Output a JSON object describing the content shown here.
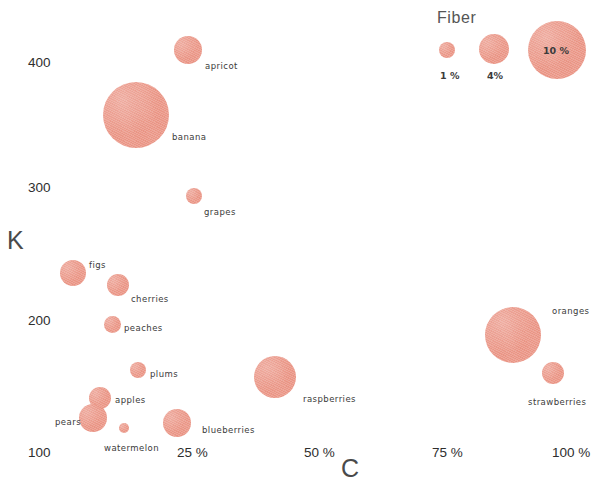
{
  "chart_data": {
    "type": "scatter",
    "title": "",
    "xlabel": "C",
    "ylabel": "K",
    "xlim": [
      0,
      112
    ],
    "ylim": [
      75,
      440
    ],
    "grid": false,
    "x_unit": "%",
    "y_unit": "mg",
    "size_variable": "Fiber",
    "size_unit": "%",
    "bubble_color": "#ec9585",
    "xticks": [
      "25 %",
      "50 %",
      "75 %",
      "100 %"
    ],
    "xtick_values": [
      25,
      50,
      75,
      100
    ],
    "yticks": [
      "100",
      "200",
      "300",
      "400"
    ],
    "ytick_values": [
      100,
      200,
      300,
      400
    ],
    "points": [
      {
        "label": "banana",
        "x": 11.0,
        "y": 395,
        "fiber": 10.0,
        "px": 136,
        "py": 115,
        "r": 33,
        "lx": 172,
        "ly": 133
      },
      {
        "label": "apricot",
        "x": 21.5,
        "y": 440,
        "fiber": 4.2,
        "px": 188,
        "py": 50,
        "r": 14,
        "lx": 205,
        "ly": 62
      },
      {
        "label": "grapes",
        "x": 23.5,
        "y": 299,
        "fiber": 1.4,
        "px": 194,
        "py": 196,
        "r": 8,
        "lx": 204,
        "ly": 208
      },
      {
        "label": "figs",
        "x": 0.5,
        "y": 235,
        "fiber": 3.8,
        "px": 73,
        "py": 273,
        "r": 13,
        "lx": 89,
        "ly": 261
      },
      {
        "label": "cherries",
        "x": 9.5,
        "y": 224,
        "fiber": 2.9,
        "px": 118,
        "py": 285,
        "r": 11,
        "lx": 131,
        "ly": 295
      },
      {
        "label": "peaches",
        "x": 8.0,
        "y": 197,
        "fiber": 2.0,
        "px": 112,
        "py": 324,
        "r": 8.5,
        "lx": 124,
        "ly": 324
      },
      {
        "label": "plums",
        "x": 13.5,
        "y": 163,
        "fiber": 1.8,
        "px": 138,
        "py": 370,
        "r": 8,
        "lx": 150,
        "ly": 370
      },
      {
        "label": "apples",
        "x": 6.0,
        "y": 136,
        "fiber": 2.7,
        "px": 100,
        "py": 398,
        "r": 11,
        "lx": 115,
        "ly": 396
      },
      {
        "label": "pears",
        "x": 4.5,
        "y": 119,
        "fiber": 3.4,
        "px": 93,
        "py": 418,
        "r": 14,
        "lx": 55,
        "ly": 418
      },
      {
        "label": "watermelon",
        "x": 11.0,
        "y": 110,
        "fiber": 0.5,
        "px": 124,
        "py": 428,
        "r": 5,
        "lx": 104,
        "ly": 444
      },
      {
        "label": "blueberries",
        "x": 24.0,
        "y": 116,
        "fiber": 3.6,
        "px": 177,
        "py": 423,
        "r": 14,
        "lx": 202,
        "ly": 426
      },
      {
        "label": "raspberries",
        "x": 43.0,
        "y": 151,
        "fiber": 6.5,
        "px": 275,
        "py": 377,
        "r": 21,
        "lx": 303,
        "ly": 395
      },
      {
        "label": "oranges",
        "x": 90.5,
        "y": 189,
        "fiber": 8.5,
        "px": 513,
        "py": 335,
        "r": 28,
        "lx": 552,
        "ly": 307
      },
      {
        "label": "strawberries",
        "x": 99.0,
        "y": 159,
        "fiber": 2.9,
        "px": 553,
        "py": 373,
        "r": 11,
        "lx": 528,
        "ly": 398
      }
    ]
  },
  "axes": {
    "y_title": "K",
    "x_title": "C",
    "y_ticks": [
      {
        "text": "400",
        "px": 28,
        "py": 56
      },
      {
        "text": "300",
        "px": 28,
        "py": 181
      },
      {
        "text": "200",
        "px": 28,
        "py": 314
      },
      {
        "text": "100",
        "px": 28,
        "py": 446
      }
    ],
    "x_ticks": [
      {
        "text": "25 %",
        "px": 177,
        "py": 446
      },
      {
        "text": "50 %",
        "px": 304,
        "py": 446
      },
      {
        "text": "75 %",
        "px": 432,
        "py": 446
      },
      {
        "text": "100 %",
        "px": 552,
        "py": 446
      }
    ]
  },
  "legend": {
    "title": "Fiber",
    "title_px": 437,
    "title_py": 10,
    "items": [
      {
        "label": "1 %",
        "value": 1,
        "cx": 447,
        "cy": 50,
        "r": 8,
        "lx": 440,
        "ly": 71,
        "inside": false
      },
      {
        "label": "4%",
        "value": 4,
        "cx": 494,
        "cy": 49,
        "r": 15,
        "lx": 487,
        "ly": 71,
        "inside": false
      },
      {
        "label": "10 %",
        "value": 10,
        "cx": 557,
        "cy": 50,
        "r": 29,
        "lx": 543,
        "ly": 46,
        "inside": true
      }
    ]
  }
}
